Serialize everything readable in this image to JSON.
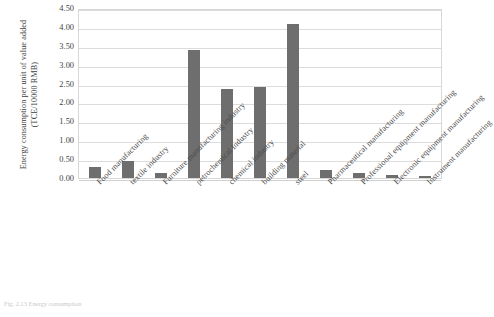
{
  "chart_data": {
    "type": "bar",
    "title": "",
    "xlabel": "",
    "ylabel": "Energy consumption per unit of value added (TCE/10000 RMB)",
    "ylabel_line1": "Energy consumption per unit of value added",
    "ylabel_line2": "(TCE/10000 RMB)",
    "ylim": [
      0.0,
      4.5
    ],
    "ytick_labels": [
      "0.00",
      "0.50",
      "1.00",
      "1.50",
      "2.00",
      "2.50",
      "3.00",
      "3.50",
      "4.00",
      "4.50"
    ],
    "ytick_values": [
      0.0,
      0.5,
      1.0,
      1.5,
      2.0,
      2.5,
      3.0,
      3.5,
      4.0,
      4.5
    ],
    "grid": true,
    "legend": false,
    "legend_position": "none",
    "bar_color": "#6e6e6e",
    "grid_color": "#dcdcdc",
    "categories": [
      "Food manufacturing",
      "textile industry",
      "Furniture manufacturing industry",
      "petrochemical industry",
      "chemical industry",
      "building material",
      "steel",
      "Pharmaceutical manufacturing",
      "Professional equipment manufacturing",
      "Electronic equipment manufacturing",
      "Instrument manufacturing"
    ],
    "values": [
      0.3,
      0.45,
      0.12,
      3.4,
      2.35,
      2.4,
      4.07,
      0.22,
      0.13,
      0.07,
      0.06
    ]
  },
  "caption": "Fig. 2.13  Energy consumption"
}
